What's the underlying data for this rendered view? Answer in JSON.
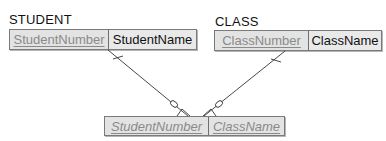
{
  "entities": {
    "student": {
      "label": "STUDENT",
      "attributes": [
        {
          "name": "StudentNumber",
          "is_key": true
        },
        {
          "name": "StudentName",
          "is_key": false
        }
      ]
    },
    "class": {
      "label": "CLASS",
      "attributes": [
        {
          "name": "ClassNumber",
          "is_key": true
        },
        {
          "name": "ClassName",
          "is_key": false
        }
      ]
    },
    "intersection": {
      "label": "",
      "attributes": [
        {
          "name": "StudentNumber",
          "is_key": true,
          "italic": true
        },
        {
          "name": "ClassName",
          "is_key": true,
          "italic": true
        }
      ]
    }
  },
  "relationships": [
    {
      "from": "STUDENT.StudentNumber",
      "to": "intersection",
      "from_cardinality": "one (mandatory)",
      "to_cardinality": "zero-or-many"
    },
    {
      "from": "CLASS.ClassNumber",
      "to": "intersection",
      "from_cardinality": "one (mandatory)",
      "to_cardinality": "zero-or-many"
    }
  ],
  "colors": {
    "key_text": "#8a8a8a",
    "text": "#111111",
    "cell_bg": "#e6e6e6",
    "border": "#7a7a7a",
    "line": "#333333"
  }
}
